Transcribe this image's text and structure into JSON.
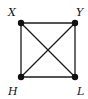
{
  "diagram": {
    "type": "graph",
    "nodes": [
      {
        "id": "X",
        "label": "X",
        "x": 21,
        "y": 23,
        "lx": 8,
        "ly": 16
      },
      {
        "id": "Y",
        "label": "Y",
        "x": 75,
        "y": 23,
        "lx": 76,
        "ly": 16
      },
      {
        "id": "H",
        "label": "H",
        "x": 21,
        "y": 77,
        "lx": 8,
        "ly": 95
      },
      {
        "id": "L",
        "label": "L",
        "x": 75,
        "y": 77,
        "lx": 77,
        "ly": 95
      }
    ],
    "edges": [
      {
        "from": "X",
        "to": "Y"
      },
      {
        "from": "Y",
        "to": "L"
      },
      {
        "from": "L",
        "to": "H"
      },
      {
        "from": "H",
        "to": "X"
      },
      {
        "from": "X",
        "to": "L"
      },
      {
        "from": "Y",
        "to": "H"
      }
    ]
  }
}
